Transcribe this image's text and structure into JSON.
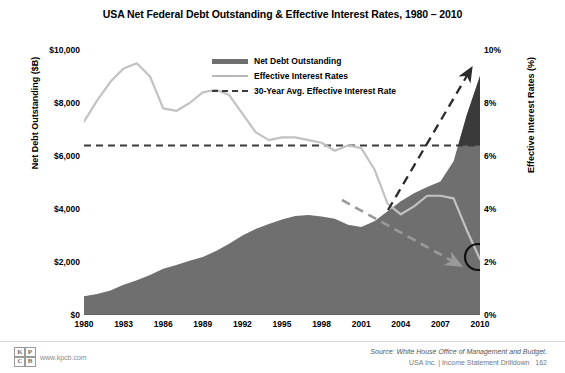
{
  "title": "USA Net Federal Debt Outstanding & Effective Interest Rates, 1980 – 2010",
  "legend": {
    "items": [
      {
        "label": "Net Debt Outstanding",
        "key": "area-swatch"
      },
      {
        "label": "Effective Interest Rates",
        "key": "line-swatch"
      },
      {
        "label": "30-Year Avg. Effective Interest Rate",
        "key": "dashed-swatch"
      }
    ]
  },
  "axes": {
    "left_title": "Net Debt Outstanding ($B)",
    "right_title": "Effective Interest Rates (%)",
    "left_ticks": [
      "$10,000",
      "$8,000",
      "$6,000",
      "$4,000",
      "$2,000",
      "$0"
    ],
    "right_ticks": [
      "10%",
      "8%",
      "6%",
      "4%",
      "2%",
      "0%"
    ],
    "x_ticks": [
      "1980",
      "1983",
      "1986",
      "1989",
      "1992",
      "1995",
      "1998",
      "2001",
      "2004",
      "2007",
      "2010"
    ]
  },
  "footer": {
    "source": "Source: White House Office of Management and Budget.",
    "deck": "USA Inc. | Income Statement Drilldown",
    "page": "162",
    "logo_cells": [
      "K",
      "P",
      "C",
      "B"
    ],
    "url": "www.kpcb.com"
  },
  "colors": {
    "area": "#6f6f6f",
    "area_dark": "#3a3a3a",
    "rate_line": "#b7b7b7",
    "avg_line": "#3a3a3a",
    "annotation": "#2b2b2b",
    "text": "#000000"
  },
  "chart_data": {
    "type": "area",
    "title": "USA Net Federal Debt Outstanding & Effective Interest Rates, 1980 – 2010",
    "xlabel": "",
    "ylabel": "Net Debt Outstanding ($B)",
    "y2label": "Effective Interest Rates (%)",
    "ylim": [
      0,
      10000
    ],
    "y2lim": [
      0,
      10
    ],
    "xlim": [
      1980,
      2010
    ],
    "grid": false,
    "legend_position": "top-center",
    "x": [
      1980,
      1981,
      1982,
      1983,
      1984,
      1985,
      1986,
      1987,
      1988,
      1989,
      1990,
      1991,
      1992,
      1993,
      1994,
      1995,
      1996,
      1997,
      1998,
      1999,
      2000,
      2001,
      2002,
      2003,
      2004,
      2005,
      2006,
      2007,
      2008,
      2009,
      2010
    ],
    "series": [
      {
        "name": "Net Debt Outstanding",
        "axis": "left",
        "unit": "$B",
        "type": "area",
        "values": [
          712,
          789,
          925,
          1137,
          1307,
          1507,
          1741,
          1890,
          2051,
          2190,
          2412,
          2689,
          2999,
          3248,
          3433,
          3604,
          3734,
          3772,
          3721,
          3632,
          3410,
          3320,
          3540,
          3913,
          4296,
          4592,
          4829,
          5035,
          5803,
          7545,
          9019
        ]
      },
      {
        "name": "Effective Interest Rates",
        "axis": "right",
        "unit": "%",
        "type": "line",
        "values": [
          7.3,
          8.1,
          8.8,
          9.3,
          9.5,
          9.0,
          7.8,
          7.7,
          8.0,
          8.4,
          8.5,
          8.3,
          7.6,
          6.9,
          6.6,
          6.7,
          6.7,
          6.6,
          6.5,
          6.2,
          6.4,
          6.3,
          5.5,
          4.2,
          3.8,
          4.1,
          4.5,
          4.5,
          4.4,
          3.2,
          2.1
        ]
      },
      {
        "name": "30-Year Avg. Effective Interest Rate",
        "axis": "right",
        "unit": "%",
        "type": "hline",
        "value": 6.4
      }
    ],
    "annotations": [
      {
        "type": "arrow",
        "direction": "up-right",
        "note": "debt accelerating"
      },
      {
        "type": "arrow",
        "direction": "down-right",
        "note": "interest rates falling"
      },
      {
        "type": "circle",
        "at_year": 2010,
        "at_value": 2.1,
        "note": "2010 effective interest rate"
      }
    ]
  }
}
